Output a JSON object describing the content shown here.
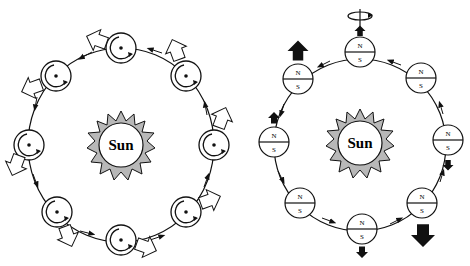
{
  "left_diagram": {
    "sun_label": "Sun",
    "description": "Planet with spin (rotation) orbiting sun; hollow arrows show orientation",
    "colors": {
      "sun_fill": "#b8b8b8",
      "line": "#111111",
      "arrow_fill": "#ffffff"
    }
  },
  "right_diagram": {
    "sun_label": "Sun",
    "description": "Magnet-like body orbiting sun with N/S poles; black arrows show force",
    "pole_north": "N",
    "pole_south": "S",
    "colors": {
      "sun_fill": "#b8b8b8",
      "line": "#111111",
      "arrow_fill": "#111111"
    }
  }
}
